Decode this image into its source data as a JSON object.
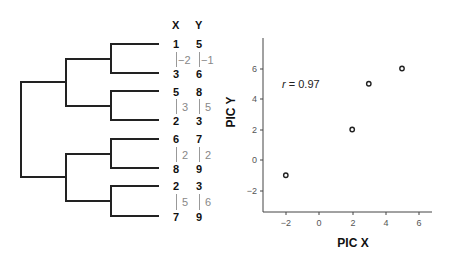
{
  "tree": {
    "header_x": "X",
    "header_y": "Y",
    "tips": [
      {
        "x": "1",
        "y": "5"
      },
      {
        "x": "3",
        "y": "6"
      },
      {
        "x": "5",
        "y": "8"
      },
      {
        "x": "2",
        "y": "3"
      },
      {
        "x": "6",
        "y": "7"
      },
      {
        "x": "8",
        "y": "9"
      },
      {
        "x": "2",
        "y": "3"
      },
      {
        "x": "7",
        "y": "9"
      }
    ],
    "contrasts": [
      {
        "x": "−2",
        "y": "−1"
      },
      {
        "x": "3",
        "y": "5"
      },
      {
        "x": "2",
        "y": "2"
      },
      {
        "x": "5",
        "y": "6"
      }
    ]
  },
  "chart_data": {
    "type": "scatter",
    "title": "",
    "xlabel": "PIC X",
    "ylabel": "PIC Y",
    "x": [
      -2,
      2,
      3,
      5
    ],
    "y": [
      -1,
      2,
      5,
      6
    ],
    "xlim": [
      -3.4,
      6.8
    ],
    "ylim": [
      -3.4,
      8
    ],
    "xticks": [
      "−2",
      "0",
      "2",
      "4",
      "6"
    ],
    "yticks": [
      "−2",
      "0",
      "2",
      "4",
      "6"
    ],
    "annotation": "r = 0.97",
    "annotation_r": "r",
    "annotation_rest": " = 0.97",
    "grid": false,
    "legend": null
  }
}
